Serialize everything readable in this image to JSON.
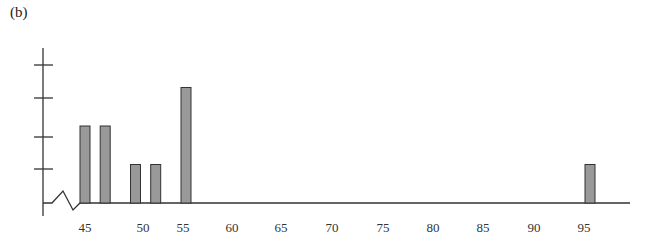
{
  "panel_label": "(b)",
  "chart_data": {
    "type": "bar",
    "title": "",
    "xlabel": "",
    "ylabel": "",
    "x_tick_labels": [
      "45",
      "50",
      "55",
      "60",
      "65",
      "70",
      "75",
      "80",
      "85",
      "90",
      "95"
    ],
    "y_ticks_count": 4,
    "y_tick_labels": [],
    "axis_break": "zigzag between origin and 45 on x-axis",
    "categories": [
      45,
      47,
      50,
      52,
      55,
      95
    ],
    "values": [
      2,
      2,
      1,
      1,
      3,
      1
    ],
    "bar_color": "#999999",
    "bar_edge_color": "#333333",
    "xlim": [
      45,
      100
    ],
    "ylim": [
      0,
      4
    ],
    "grid": false,
    "legend": null
  }
}
